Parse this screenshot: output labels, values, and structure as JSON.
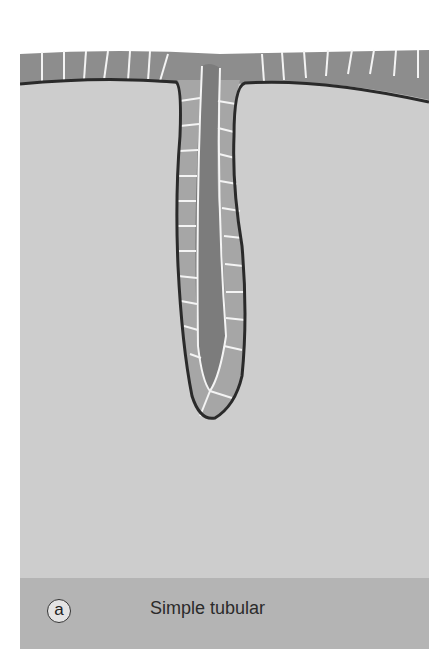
{
  "figure": {
    "panel_label": "a",
    "caption": "Simple tubular",
    "colors": {
      "connective_tissue": "#cdcdcd",
      "epithelium_cell": "#8d8d8d",
      "gland_cell": "#a6a6a6",
      "lumen": "#7c7c7c",
      "basement_membrane": "#2a2a2a",
      "cell_border": "#f4f4f4",
      "caption_band": "#b4b4b4"
    }
  }
}
